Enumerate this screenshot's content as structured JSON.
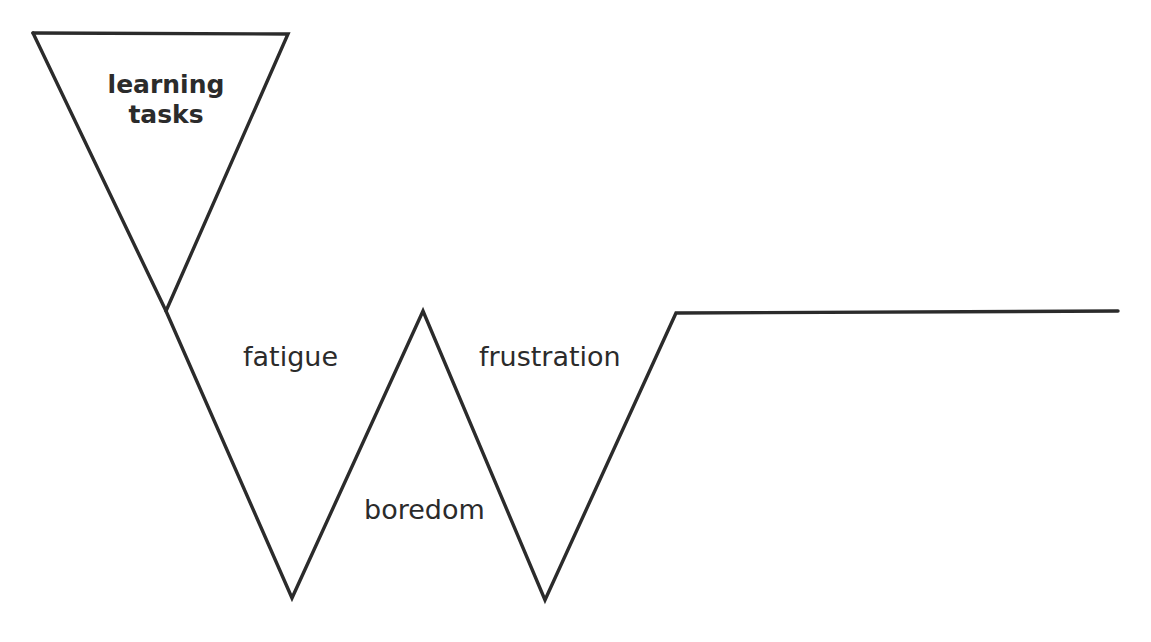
{
  "diagram": {
    "background_color": "#ffffff",
    "stroke_color": "#2b2b2b",
    "stroke_width": 3.4,
    "labels": {
      "funnel": "learning\ntasks",
      "first_descent": "fatigue",
      "first_valley": "boredom",
      "second_descent": "frustration"
    }
  },
  "chart_data": {
    "type": "line",
    "xlabel": "",
    "ylabel": "",
    "xlim": [
      0,
      1151
    ],
    "ylim": [
      642,
      0
    ],
    "grid": false,
    "legend": "none",
    "series": [
      {
        "name": "progression-line",
        "points": [
          [
            33,
            33
          ],
          [
            166,
            311
          ],
          [
            292,
            598
          ],
          [
            423,
            311
          ],
          [
            545,
            600
          ],
          [
            676,
            313
          ],
          [
            1118,
            311
          ]
        ]
      },
      {
        "name": "funnel-triangle",
        "closed": false,
        "points": [
          [
            33,
            33
          ],
          [
            288,
            34
          ],
          [
            166,
            311
          ]
        ]
      }
    ],
    "annotations": [
      {
        "text": "learning tasks",
        "x": 166,
        "y": 110,
        "weight": "bold"
      },
      {
        "text": "fatigue",
        "x": 290,
        "y": 360,
        "weight": "normal"
      },
      {
        "text": "boredom",
        "x": 421,
        "y": 513,
        "weight": "normal"
      },
      {
        "text": "frustration",
        "x": 549,
        "y": 360,
        "weight": "normal"
      }
    ]
  }
}
